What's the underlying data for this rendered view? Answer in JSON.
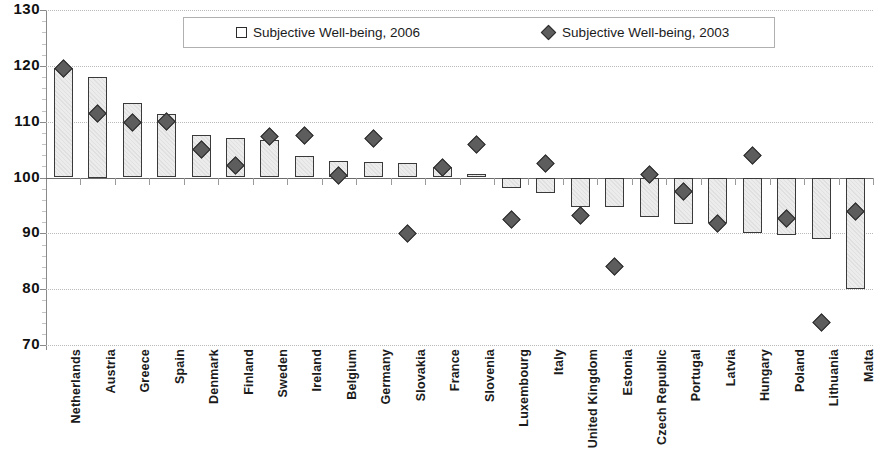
{
  "chart_data": {
    "type": "bar",
    "title": "",
    "subtitle": "",
    "xlabel": "",
    "ylabel": "",
    "ylim": [
      70,
      130
    ],
    "ytick_step": 10,
    "ytick_labels": [
      "130",
      "120",
      "110",
      "100",
      "90",
      "80",
      "70"
    ],
    "grid": true,
    "baseline": 100,
    "legend_position": "top-center",
    "categories": [
      "Netherlands",
      "Austria",
      "Greece",
      "Spain",
      "Denmark",
      "Finland",
      "Sweden",
      "Ireland",
      "Belgium",
      "Germany",
      "Slovakia",
      "France",
      "Slovenia",
      "Luxembourg",
      "Italy",
      "United Kingdom",
      "Estonia",
      "Czech Republic",
      "Portugal",
      "Latvia",
      "Hungary",
      "Poland",
      "Lithuania",
      "Malta"
    ],
    "series": [
      {
        "name": "Subjective Well-being, 2006",
        "marker": "square",
        "render": "bar",
        "values": [
          119.7,
          118.0,
          113.3,
          111.3,
          107.6,
          107.0,
          106.8,
          103.8,
          102.9,
          102.7,
          102.6,
          101.8,
          100.6,
          98.2,
          97.3,
          94.8,
          94.8,
          92.9,
          91.6,
          91.9,
          90.1,
          89.7,
          89.0,
          80.0
        ]
      },
      {
        "name": "Subjective Well-being, 2003",
        "marker": "diamond",
        "render": "point",
        "values": [
          119.5,
          111.5,
          109.8,
          110.1,
          105.1,
          102.2,
          107.4,
          107.5,
          100.4,
          106.9,
          90.0,
          101.8,
          105.9,
          92.4,
          102.5,
          93.2,
          84.1,
          100.6,
          97.5,
          91.7,
          104.0,
          92.7,
          74.0,
          94.0
        ]
      }
    ],
    "colors": {
      "bar_fill": "#ececec",
      "bar_border": "#3a3a3a",
      "marker_fill": "#5d5d5d",
      "marker_border": "#2b2b2b",
      "grid": "#b9b9b9",
      "axis": "#8a8a8a",
      "text": "#1b1b1b"
    }
  },
  "legend": {
    "entries": [
      {
        "label": "Subjective Well-being, 2006",
        "marker": "square"
      },
      {
        "label": "Subjective Well-being, 2003",
        "marker": "diamond"
      }
    ]
  }
}
